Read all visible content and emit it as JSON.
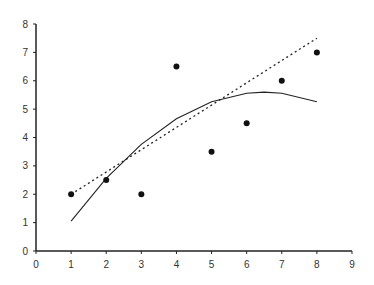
{
  "chart_data": {
    "type": "scatter",
    "title": "",
    "xlabel": "",
    "ylabel": "",
    "xlim": [
      0,
      9
    ],
    "ylim": [
      0,
      8
    ],
    "grid": false,
    "legend": null,
    "x_ticks": [
      0,
      1,
      2,
      3,
      4,
      5,
      6,
      7,
      8,
      9
    ],
    "y_ticks": [
      0,
      1,
      2,
      3,
      4,
      5,
      6,
      7,
      8
    ],
    "series": [
      {
        "name": "data points",
        "type": "scatter",
        "x": [
          1,
          2,
          3,
          4,
          5,
          6,
          7,
          8
        ],
        "y": [
          2,
          2.5,
          2,
          6.5,
          3.5,
          4.5,
          6,
          7
        ]
      },
      {
        "name": "linear fit",
        "type": "line",
        "style": "dotted",
        "x": [
          1,
          8
        ],
        "y": [
          2,
          7.5
        ]
      },
      {
        "name": "quadratic fit",
        "type": "line",
        "style": "solid",
        "x": [
          1,
          2,
          3,
          4,
          5,
          6,
          6.5,
          7,
          8
        ],
        "y": [
          1.05,
          2.56,
          3.76,
          4.66,
          5.26,
          5.56,
          5.6,
          5.56,
          5.26
        ]
      }
    ]
  }
}
